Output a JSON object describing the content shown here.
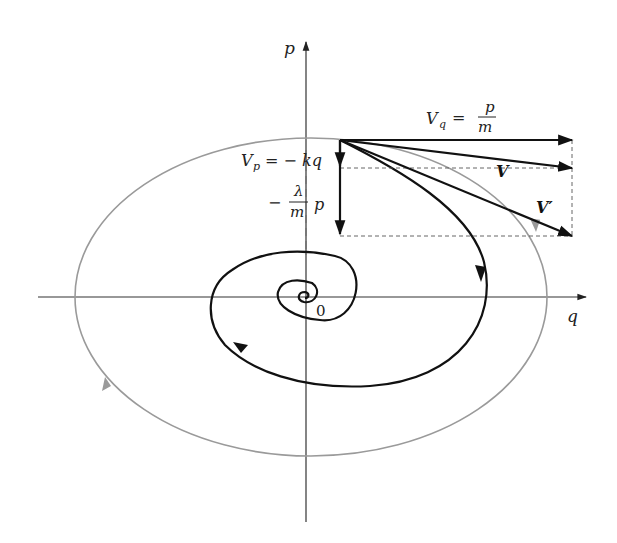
{
  "diagram": {
    "axes": {
      "horizontal_label": "q",
      "vertical_label": "p",
      "origin_label": "0"
    },
    "vectors": {
      "vq_label_lhs": "V",
      "vq_label_sub": "q",
      "vq_label_eq": "=",
      "vq_label_num": "p",
      "vq_label_den": "m",
      "vp_label_lhs": "V",
      "vp_label_sub": "p",
      "vp_label_rhs": "= − kq",
      "damping_label_minus": "−",
      "damping_label_num": "λ",
      "damping_label_den": "m",
      "damping_label_var": "p",
      "v_label": "V",
      "v_prime_label": "V′"
    },
    "curves": [
      {
        "name": "undamped-ellipse",
        "color": "#9a9a9a",
        "direction": "clockwise"
      },
      {
        "name": "damped-spiral",
        "color": "#111111",
        "direction": "clockwise, spiraling into origin"
      }
    ],
    "colors": {
      "axis": "#333333",
      "ellipse": "#9a9a9a",
      "spiral": "#111111",
      "vector": "#111111",
      "dashed": "#555555"
    }
  }
}
